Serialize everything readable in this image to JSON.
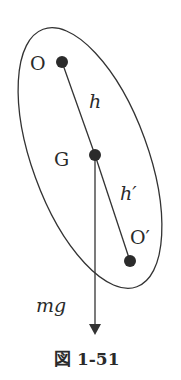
{
  "figure": {
    "caption": "図 1-51",
    "labels": {
      "O": "O",
      "G": "G",
      "O_prime": "O′",
      "h": "h",
      "h_prime": "h′",
      "mg": "mg"
    },
    "points": {
      "O": [
        62,
        62
      ],
      "G": [
        95,
        155
      ],
      "O_prime": [
        130,
        261
      ]
    },
    "ellipse": {
      "cx": 90,
      "cy": 158,
      "rx": 58,
      "ry": 137,
      "rotate": -20
    },
    "arrow": {
      "x": 95,
      "y_start": 155,
      "y_end": 333
    },
    "colors": {
      "stroke": "#333333",
      "dot": "#2b2b2b"
    }
  }
}
